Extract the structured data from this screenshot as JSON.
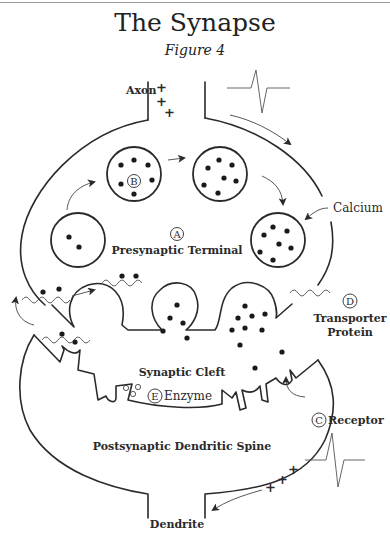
{
  "title": "The Synapse",
  "subtitle": "Figure 4",
  "labels": {
    "axon": "Axon",
    "presynaptic_terminal": "Presynaptic Terminal",
    "calcium": "Calcium",
    "transporter_protein_line1": "Transporter",
    "transporter_protein_line2": "Protein",
    "synaptic_cleft": "Synaptic Cleft",
    "enzyme": "Enzyme",
    "receptor": "Receptor",
    "postsynaptic_dendritic_spine": "Postsynaptic Dendritic Spine",
    "dendrite": "Dendrite"
  },
  "markers": {
    "A": "A",
    "B": "B",
    "C": "C",
    "D": "D",
    "E": "E"
  },
  "charges": {
    "plus": "+"
  },
  "colors": {
    "line": "#2a2a2a",
    "text": "#2a2a2a",
    "background": "#ffffff",
    "thin_line": "#555555"
  }
}
